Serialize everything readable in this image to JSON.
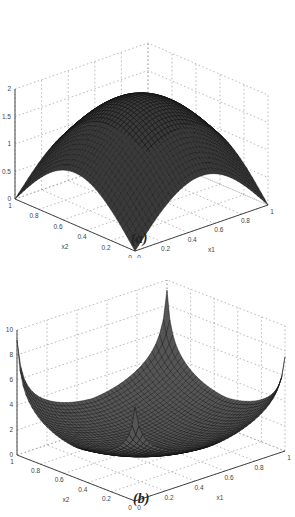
{
  "chart_data": [
    {
      "type": "surface",
      "panel": "a",
      "caption": "(a)",
      "title": "",
      "xlabel": "x1",
      "ylabel": "x2",
      "zlabel": "S(x1,x2)",
      "xticks": [
        "0",
        "0.2",
        "0.4",
        "0.6",
        "0.8",
        "1"
      ],
      "yticks": [
        "0",
        "0.2",
        "0.4",
        "0.6",
        "0.8",
        "1"
      ],
      "zticks": [
        "0",
        "0.5",
        "1",
        "1.5",
        "2"
      ],
      "xlim": [
        0,
        1
      ],
      "ylim": [
        0,
        1
      ],
      "zlim": [
        0,
        2
      ],
      "grid": true,
      "description": "Dome-shaped mesh surface: value 0 at the four corners, rising to a maximum of about 1.9 near the center (x1=0.5, x2=0.5)",
      "samples": [
        {
          "x1": 0,
          "x2": 0,
          "z": 0
        },
        {
          "x1": 1,
          "x2": 0,
          "z": 0
        },
        {
          "x1": 0,
          "x2": 1,
          "z": 0
        },
        {
          "x1": 1,
          "x2": 1,
          "z": 0
        },
        {
          "x1": 0.5,
          "x2": 0,
          "z": 1.0
        },
        {
          "x1": 0,
          "x2": 0.5,
          "z": 1.0
        },
        {
          "x1": 0.5,
          "x2": 0.5,
          "z": 1.9
        }
      ]
    },
    {
      "type": "surface",
      "panel": "b",
      "caption": "(b)",
      "title": "",
      "xlabel": "x1",
      "ylabel": "x2",
      "zlabel": "S(x1,x2)",
      "xticks": [
        "0",
        "0.2",
        "0.4",
        "0.6",
        "0.8",
        "1"
      ],
      "yticks": [
        "0",
        "0.2",
        "0.4",
        "0.6",
        "0.8",
        "1"
      ],
      "zticks": [
        "0",
        "2",
        "4",
        "6",
        "8",
        "10"
      ],
      "xlim": [
        0,
        1
      ],
      "ylim": [
        0,
        1
      ],
      "zlim": [
        0,
        10
      ],
      "grid": true,
      "description": "Bowl-shaped mesh surface: minimum near 0.5 at center, cusp-like peaks at the four corners reaching about 9",
      "samples": [
        {
          "x1": 0,
          "x2": 0,
          "z": 6
        },
        {
          "x1": 1,
          "x2": 0,
          "z": 6
        },
        {
          "x1": 0,
          "x2": 1,
          "z": 9
        },
        {
          "x1": 1,
          "x2": 1,
          "z": 9
        },
        {
          "x1": 0.5,
          "x2": 0,
          "z": 2
        },
        {
          "x1": 0.5,
          "x2": 0.5,
          "z": 0.5
        }
      ]
    }
  ]
}
